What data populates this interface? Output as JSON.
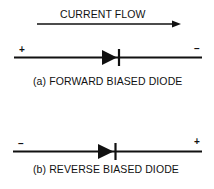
{
  "current_flow": {
    "label": "CURRENT FLOW",
    "direction": "left-to-right"
  },
  "diagrams": [
    {
      "id": "a",
      "caption": "(a) FORWARD BIASED DIODE",
      "left_terminal": "+",
      "right_terminal": "–"
    },
    {
      "id": "b",
      "caption": "(b) REVERSE BIASED DIODE",
      "left_terminal": "–",
      "right_terminal": "+"
    }
  ],
  "colors": {
    "ink": "#111111",
    "background": "#ffffff"
  }
}
